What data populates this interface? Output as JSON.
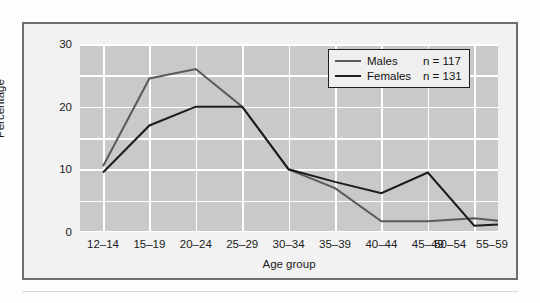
{
  "chart_data": {
    "type": "line",
    "title": "",
    "xlabel": "Age group",
    "ylabel": "Percentage",
    "categories": [
      "12–14",
      "15–19",
      "20–24",
      "25–29",
      "30–34",
      "35–39",
      "40–44",
      "45–49",
      "50–54",
      "55–59"
    ],
    "ylim": [
      0,
      30
    ],
    "yticks": [
      0,
      10,
      20,
      30
    ],
    "ytick_labels": [
      "0",
      "10",
      "20",
      "30"
    ],
    "grid": true,
    "grid_minor_step": 5,
    "legend_position": "top-right",
    "series": [
      {
        "name": "Males",
        "n_label": "n = 117",
        "n": 117,
        "color": "#5a5a5a",
        "values": [
          10.5,
          24.5,
          26.0,
          20.0,
          10.0,
          7.0,
          1.7,
          1.7,
          2.2,
          1.4
        ]
      },
      {
        "name": "Females",
        "n_label": "n = 131",
        "n": 131,
        "color": "#1c1c1c",
        "values": [
          9.5,
          17.0,
          20.0,
          20.0,
          10.0,
          8.0,
          6.2,
          9.5,
          1.0,
          1.4
        ]
      }
    ]
  },
  "colors": {
    "plot_background": "#c9c9c9",
    "gridline": "#ffffff",
    "figure_border": "#6e6e6e",
    "figure_background": "#f2f2f2",
    "males_line": "#5a5a5a",
    "females_line": "#1c1c1c",
    "text": "#1a1a1a"
  }
}
